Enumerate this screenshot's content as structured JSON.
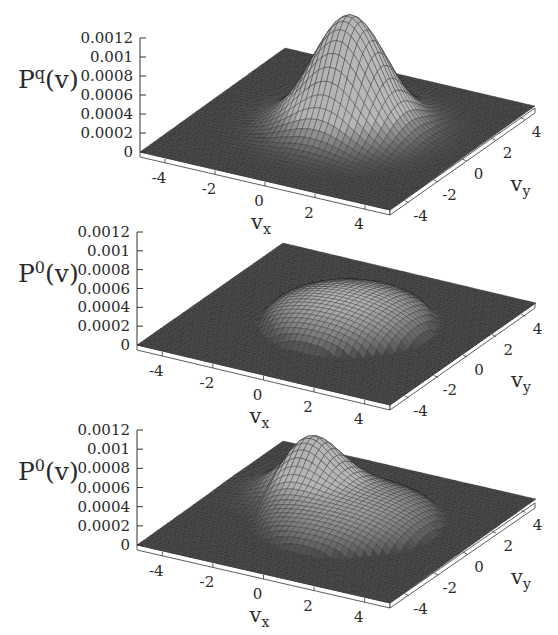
{
  "figure": {
    "panels": [
      {
        "id": "panel-1",
        "zlabel": "P",
        "zlabel_sup": "q",
        "zlabel_tail": "(v)",
        "shape": "gaussian-peak",
        "ztick_labels": [
          "0",
          "0.0002",
          "0.0004",
          "0.0006",
          "0.0008",
          "0.001",
          "0.0012"
        ],
        "xtick_labels": [
          "-4",
          "-2",
          "0",
          "2",
          "4"
        ],
        "ytick_labels": [
          "-4",
          "-2",
          "0",
          "2",
          "4"
        ],
        "xlabel": "v",
        "xlabel_sub": "x",
        "ylabel": "v",
        "ylabel_sub": "y"
      },
      {
        "id": "panel-2",
        "zlabel": "P",
        "zlabel_sup": "0",
        "zlabel_tail": "(v)",
        "shape": "flat-dome",
        "ztick_labels": [
          "0",
          "0.0002",
          "0.0004",
          "0.0006",
          "0.0008",
          "0.001",
          "0.0012"
        ],
        "xtick_labels": [
          "-4",
          "-2",
          "0",
          "2",
          "4"
        ],
        "ytick_labels": [
          "-4",
          "-2",
          "0",
          "2",
          "4"
        ],
        "xlabel": "v",
        "xlabel_sub": "x",
        "ylabel": "v",
        "ylabel_sub": "y"
      },
      {
        "id": "panel-3",
        "zlabel": "P",
        "zlabel_sup": "0",
        "zlabel_tail": "(v)",
        "shape": "ring-with-lobe",
        "ztick_labels": [
          "0",
          "0.0002",
          "0.0004",
          "0.0006",
          "0.0008",
          "0.001",
          "0.0012"
        ],
        "xtick_labels": [
          "-4",
          "-2",
          "0",
          "2",
          "4"
        ],
        "ytick_labels": [
          "-4",
          "-2",
          "0",
          "2",
          "4"
        ],
        "xlabel": "v",
        "xlabel_sub": "x",
        "ylabel": "v",
        "ylabel_sub": "y"
      }
    ]
  },
  "chart_data": [
    {
      "type": "surface",
      "title": "",
      "xlabel": "v_x",
      "ylabel": "v_y",
      "zlabel": "P^q(v)",
      "xlim": [
        -5,
        5
      ],
      "ylim": [
        -5,
        5
      ],
      "zlim": [
        0,
        0.0012
      ],
      "xticks": [
        -4,
        -2,
        0,
        2,
        4
      ],
      "yticks": [
        -4,
        -2,
        0,
        2,
        4
      ],
      "zticks": [
        0,
        0.0002,
        0.0004,
        0.0006,
        0.0008,
        0.001,
        0.0012
      ],
      "description": "Single Gaussian-like peak centered near (0,0), max ≈ 0.00118, width σ ≈ 1.3; slight depression ring around base",
      "peak": {
        "center": [
          0.3,
          0.3
        ],
        "height": 0.00118,
        "sigma": 1.3
      }
    },
    {
      "type": "surface",
      "title": "",
      "xlabel": "v_x",
      "ylabel": "v_y",
      "zlabel": "P^0(v)",
      "xlim": [
        -5,
        5
      ],
      "ylim": [
        -5,
        5
      ],
      "zlim": [
        0,
        0.0012
      ],
      "xticks": [
        -4,
        -2,
        0,
        2,
        4
      ],
      "yticks": [
        -4,
        -2,
        0,
        2,
        4
      ],
      "zticks": [
        0,
        0.0002,
        0.0004,
        0.0006,
        0.0008,
        0.001,
        0.0012
      ],
      "description": "Broad flat-topped dome centered near (0,0), height ≈ 0.0003, radius ≈ 3",
      "peak": {
        "center": [
          0.3,
          0.3
        ],
        "height": 0.0003,
        "radius": 3.0
      }
    },
    {
      "type": "surface",
      "title": "",
      "xlabel": "v_x",
      "ylabel": "v_y",
      "zlabel": "P^0(v)",
      "xlim": [
        -5,
        5
      ],
      "ylim": [
        -5,
        5
      ],
      "zlim": [
        0,
        0.0012
      ],
      "xticks": [
        -4,
        -2,
        0,
        2,
        4
      ],
      "yticks": [
        -4,
        -2,
        0,
        2,
        4
      ],
      "zticks": [
        0,
        0.0002,
        0.0004,
        0.0006,
        0.0008,
        0.001,
        0.0012
      ],
      "description": "Broad base (height ≈ 0.00025, radius ≈ 3.2) plus a secondary lobe toward negative v_x / positive v_y of height ≈ 0.0005",
      "peak": {
        "center": [
          0.3,
          0.3
        ],
        "height": 0.00025,
        "radius": 3.2
      },
      "lobe": {
        "center": [
          -2.0,
          1.6
        ],
        "height": 0.00048,
        "sigma": 1.0
      }
    }
  ]
}
